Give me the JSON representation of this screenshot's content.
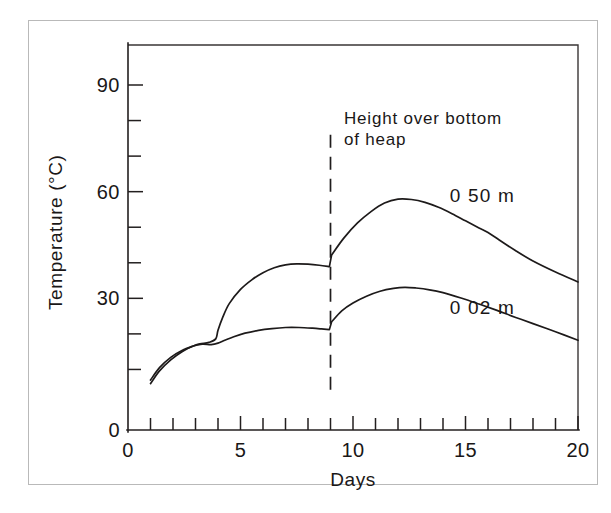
{
  "chart_data": {
    "type": "line",
    "title": "",
    "subtitle": "",
    "xlabel": "Days",
    "ylabel": "Temperature (°C)",
    "xlim": [
      0,
      20
    ],
    "ylim": [
      0,
      100
    ],
    "grid": false,
    "legend_position": "inline-curve-labels",
    "x_ticks_major": [
      0,
      5,
      10,
      15,
      20
    ],
    "x_tick_labels": [
      "0",
      "5",
      "10",
      "15",
      "20"
    ],
    "x_ticks_minor_step": 1,
    "y_ticks_major": [
      0,
      30,
      60,
      90
    ],
    "y_tick_labels": [
      "0",
      "30",
      "60",
      "90"
    ],
    "y_ticks_minor_step": 10,
    "annotations": [
      {
        "name": "height-note",
        "text_line1": "Height over bottom",
        "text_line2": "of heap",
        "x": 9.6,
        "y": 79
      },
      {
        "name": "turning-event-marker",
        "style": "vertical-dashed-line",
        "x": 9.0,
        "y_from": 2,
        "y_to": 76
      }
    ],
    "series": [
      {
        "name": "0 50 m",
        "label": "0 50 m",
        "label_x": 14.3,
        "label_y": 57,
        "description": "Temperature at 0.50 m height over bottom of heap",
        "x": [
          1.0,
          1.4,
          1.9,
          2.4,
          2.9,
          3.2,
          3.6,
          3.9,
          4.0,
          4.2,
          4.5,
          5.0,
          5.5,
          6.0,
          6.5,
          7.0,
          7.5,
          8.0,
          8.5,
          8.95,
          9.05,
          9.6,
          10.2,
          10.8,
          11.4,
          12.0,
          12.6,
          13.2,
          13.8,
          14.4,
          15.0,
          15.6,
          16.0,
          16.5,
          17.2,
          18.0,
          19.0,
          20.0
        ],
        "y": [
          7.0,
          10.5,
          13.4,
          15.3,
          16.6,
          17.2,
          17.6,
          18.6,
          21.0,
          24.5,
          28.5,
          32.5,
          35.2,
          37.2,
          38.6,
          39.4,
          39.7,
          39.6,
          39.3,
          38.9,
          42.2,
          47.0,
          51.2,
          54.4,
          56.8,
          57.9,
          57.8,
          57.0,
          55.6,
          53.8,
          51.8,
          49.8,
          48.5,
          46.4,
          43.5,
          40.5,
          37.4,
          34.6
        ]
      },
      {
        "name": "0 02 m",
        "label": "0 02 m",
        "label_x": 14.3,
        "label_y": 25.5,
        "description": "Temperature at 0.02 m height over bottom of heap",
        "x": [
          1.0,
          1.4,
          1.9,
          2.4,
          2.9,
          3.3,
          3.7,
          4.0,
          4.3,
          4.7,
          5.2,
          5.8,
          6.4,
          7.0,
          7.6,
          8.2,
          8.6,
          8.95,
          9.05,
          9.5,
          10.0,
          10.6,
          11.2,
          11.8,
          12.3,
          12.8,
          13.4,
          14.0,
          14.8,
          15.6,
          16.4,
          17.2,
          18.0,
          19.0,
          20.0
        ],
        "y": [
          6.0,
          9.6,
          12.7,
          15.0,
          16.6,
          17.1,
          17.0,
          17.4,
          18.2,
          19.2,
          20.2,
          21.0,
          21.5,
          21.8,
          21.8,
          21.6,
          21.4,
          21.2,
          23.4,
          26.5,
          28.7,
          30.6,
          32.0,
          32.8,
          33.1,
          32.9,
          32.4,
          31.6,
          30.1,
          28.4,
          26.6,
          24.7,
          22.9,
          20.6,
          18.2
        ]
      }
    ]
  }
}
